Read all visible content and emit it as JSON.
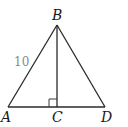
{
  "figure": {
    "type": "triangle-diagram",
    "points": {
      "A": {
        "label": "A",
        "x": 8,
        "y": 107
      },
      "B": {
        "label": "B",
        "x": 57,
        "y": 25
      },
      "C": {
        "label": "C",
        "x": 57,
        "y": 107
      },
      "D": {
        "label": "D",
        "x": 105,
        "y": 107
      }
    },
    "segments": [
      {
        "from": "A",
        "to": "B"
      },
      {
        "from": "B",
        "to": "D"
      },
      {
        "from": "A",
        "to": "D"
      },
      {
        "from": "B",
        "to": "C"
      }
    ],
    "right_angle_at": "C",
    "measurements": {
      "AB": "10"
    },
    "colors": {
      "line": "#2a2a2a",
      "label": "#1a1a1a",
      "measurement": "#8a8a8a"
    }
  }
}
